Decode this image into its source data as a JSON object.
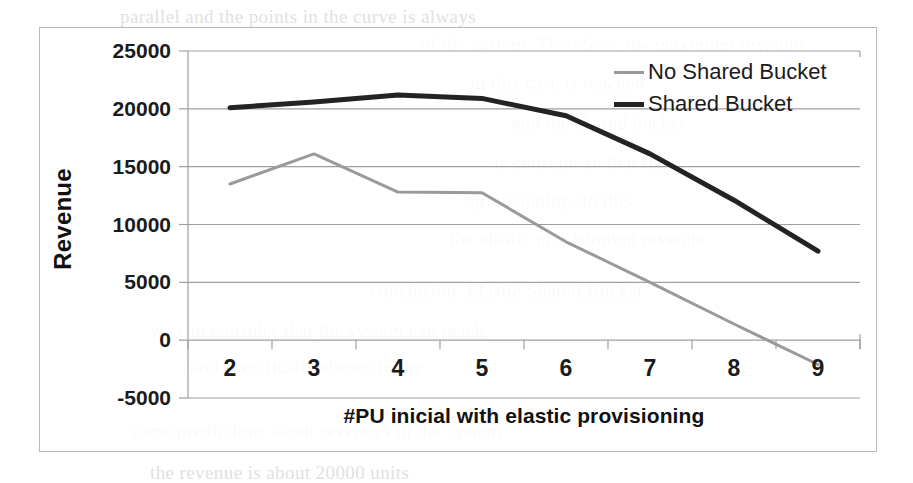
{
  "figure": {
    "background_color": "#ffffff",
    "frame_color": "#b9b9b9"
  },
  "chart_data": {
    "type": "line",
    "title": "",
    "xlabel": "#PU inicial with elastic provisioning",
    "ylabel": "Revenue",
    "categories": [
      "2",
      "3",
      "4",
      "5",
      "6",
      "7",
      "8",
      "9"
    ],
    "x": [
      2,
      3,
      4,
      5,
      6,
      7,
      8,
      9
    ],
    "series": [
      {
        "name": "No Shared Bucket",
        "color": "#9a9a9a",
        "line_width": 3,
        "values": [
          13500,
          16100,
          12800,
          12750,
          8500,
          5000,
          1400,
          -2100
        ]
      },
      {
        "name": "Shared Bucket",
        "color": "#232323",
        "line_width": 5,
        "values": [
          20100,
          20600,
          21200,
          20900,
          19400,
          16100,
          12100,
          7700
        ]
      }
    ],
    "ylim": [
      -5000,
      25000
    ],
    "ytick_labels": [
      "25000",
      "20000",
      "15000",
      "10000",
      "5000",
      "0",
      "-5000"
    ],
    "yticks": [
      25000,
      20000,
      15000,
      10000,
      5000,
      0,
      -5000
    ],
    "xtick_labels": [
      "2",
      "3",
      "4",
      "5",
      "6",
      "7",
      "8",
      "9"
    ],
    "grid": "horizontal",
    "gridline_color": "#9f9f9f",
    "legend_position": "top-right",
    "legend_entries": [
      "No Shared Bucket",
      "Shared Bucket"
    ]
  },
  "page_bleed": [
    {
      "text": "parallel and the points in the curve is always",
      "x": 120,
      "y": 6
    },
    {
      "text": "of the system. Therefore, the maximum revenue",
      "x": 420,
      "y": 34
    },
    {
      "text": "in this case is reached",
      "x": 470,
      "y": 72
    },
    {
      "text": "and the shared bucket",
      "x": 512,
      "y": 112
    },
    {
      "text": "is constant so that the",
      "x": 494,
      "y": 152
    },
    {
      "text": "provisioning. In this",
      "x": 470,
      "y": 190
    },
    {
      "text": "the elastic provisioning revenue",
      "x": 450,
      "y": 228
    },
    {
      "text": "conclusion. Elastic Shared Bucket",
      "x": 370,
      "y": 280
    },
    {
      "text": "we can consider that the system can reach",
      "x": 150,
      "y": 320
    },
    {
      "text": "and specifically shown in the",
      "x": 190,
      "y": 356
    },
    {
      "text": "some predictions about revenues in the system",
      "x": 130,
      "y": 420
    },
    {
      "text": "the revenue is about 20000 units",
      "x": 150,
      "y": 462
    }
  ]
}
